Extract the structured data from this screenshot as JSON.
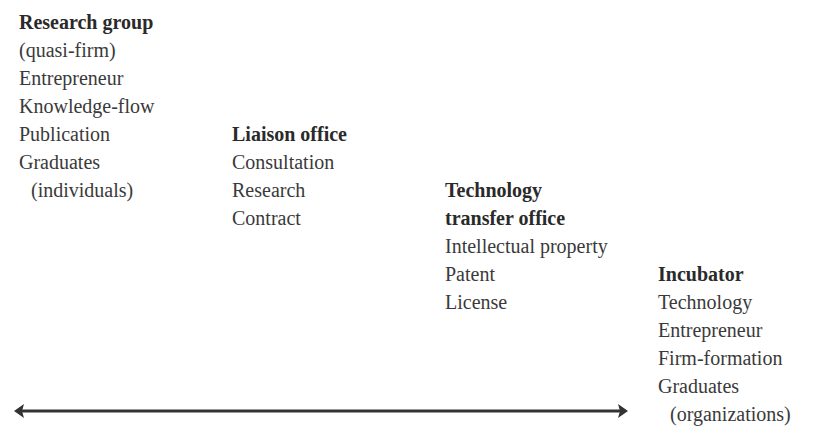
{
  "columns": [
    {
      "title_lines": [
        "Research group"
      ],
      "items": [
        "(quasi-firm)",
        "Entrepreneur",
        "Knowledge-flow",
        "Publication",
        "Graduates",
        "(individuals)"
      ]
    },
    {
      "title_lines": [
        "Liaison office"
      ],
      "items": [
        "Consultation",
        "Research",
        "Contract"
      ]
    },
    {
      "title_lines": [
        "Technology",
        "transfer office"
      ],
      "items": [
        "Intellectual property",
        "Patent",
        "License"
      ]
    },
    {
      "title_lines": [
        "Incubator"
      ],
      "items": [
        "Technology",
        "Entrepreneur",
        "Firm-formation",
        "Graduates",
        "(organizations)"
      ]
    }
  ],
  "arrow": {
    "type": "double-headed",
    "color": "#333333"
  }
}
